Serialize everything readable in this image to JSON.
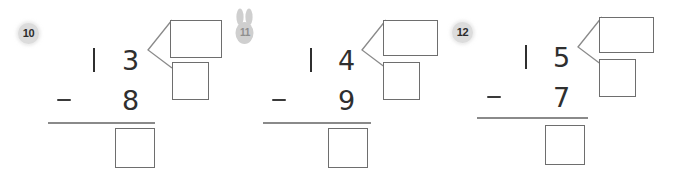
{
  "worksheet": {
    "kind": "subtraction-practice-worksheet",
    "problems": [
      {
        "badge": "10",
        "badge_style": "circle",
        "minuend": "13",
        "minuend_tens": "1",
        "minuend_ones": "3",
        "operator": "−",
        "subtrahend": "8",
        "answer": "",
        "decompose_top": "",
        "decompose_bottom": ""
      },
      {
        "badge": "11",
        "badge_style": "bunny",
        "minuend": "14",
        "minuend_tens": "1",
        "minuend_ones": "4",
        "operator": "−",
        "subtrahend": "9",
        "answer": "",
        "decompose_top": "",
        "decompose_bottom": ""
      },
      {
        "badge": "12",
        "badge_style": "circle",
        "minuend": "15",
        "minuend_tens": "1",
        "minuend_ones": "5",
        "operator": "−",
        "subtrahend": "7",
        "answer": "",
        "decompose_top": "",
        "decompose_bottom": ""
      }
    ]
  },
  "colors": {
    "badge_fill": "#dcdcdc",
    "badge_text": "#2b2b2b",
    "bunny_fill": "#cfcfcf",
    "digit": "#2f2f2f",
    "box_border": "#6e6e6e",
    "rule": "#8a8a8a",
    "background": "#ffffff"
  }
}
